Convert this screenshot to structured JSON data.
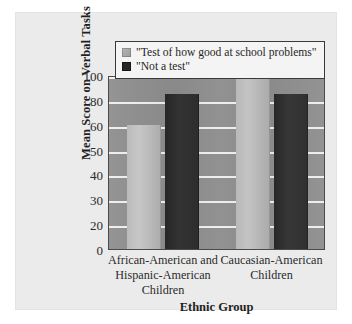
{
  "figure": {
    "panel_background": "#ebebeb",
    "plot_background": "#8e8e8e",
    "gridline_color": "#f3f3f3"
  },
  "legend": {
    "position": "top-center-inside",
    "entries": [
      {
        "label": "\"Test of how good at school problems\"",
        "swatch": "legend-swatch-light",
        "color": "#b0b0b0"
      },
      {
        "label": "\"Not a test\"",
        "swatch": "legend-swatch-dark",
        "color": "#262626"
      }
    ]
  },
  "chart_data": {
    "type": "bar",
    "title": "",
    "subtitle": "",
    "xlabel": "Ethnic Group",
    "ylabel": "Mean Score on Verbal Tasks",
    "categories": [
      "African-American and Hispanic-American Children",
      "Caucasian-American Children"
    ],
    "category_label_lines": [
      [
        "African-American and",
        "Hispanic-American",
        "Children"
      ],
      [
        "Caucasian-American",
        "Children"
      ]
    ],
    "series": [
      {
        "name": "\"Test of how good at school problems\"",
        "color": "#b0b0b0",
        "values": [
          60,
          100
        ]
      },
      {
        "name": "\"Not a test\"",
        "color": "#262626",
        "values": [
          85,
          85
        ]
      }
    ],
    "ylim": [
      0,
      105
    ],
    "yticks": [
      100,
      80,
      60,
      50,
      40,
      30,
      20,
      0
    ],
    "ytick_labels": [
      "100",
      "80",
      "60",
      "50",
      "40",
      "30",
      "20",
      "0"
    ],
    "ytick_spacing": "uniform-visual-nonuniform-values",
    "grid": true,
    "grid_axis": "y",
    "legend_position": "upper-center"
  }
}
